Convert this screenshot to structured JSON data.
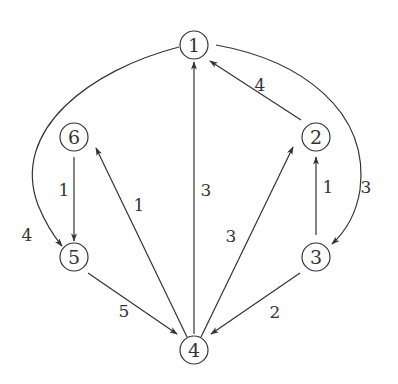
{
  "graph": {
    "type": "directed-weighted",
    "colors": {
      "stroke": "#333333",
      "background": "#ffffff"
    },
    "nodes": [
      {
        "id": "1",
        "label": "1",
        "x": 194,
        "y": 45
      },
      {
        "id": "2",
        "label": "2",
        "x": 316,
        "y": 137
      },
      {
        "id": "3",
        "label": "3",
        "x": 316,
        "y": 257
      },
      {
        "id": "4",
        "label": "4",
        "x": 194,
        "y": 350
      },
      {
        "id": "5",
        "label": "5",
        "x": 74,
        "y": 257
      },
      {
        "id": "6",
        "label": "6",
        "x": 74,
        "y": 137
      }
    ],
    "edges": [
      {
        "from": "1",
        "to": "5",
        "weight": "4",
        "curved": true
      },
      {
        "from": "6",
        "to": "5",
        "weight": "1"
      },
      {
        "from": "4",
        "to": "6",
        "weight": "1"
      },
      {
        "from": "4",
        "to": "1",
        "weight": "3"
      },
      {
        "from": "4",
        "to": "2",
        "weight": "3"
      },
      {
        "from": "2",
        "to": "1",
        "weight": "4"
      },
      {
        "from": "3",
        "to": "2",
        "weight": "1"
      },
      {
        "from": "1",
        "to": "3",
        "weight": "3",
        "curved": true
      },
      {
        "from": "5",
        "to": "4",
        "weight": "5"
      },
      {
        "from": "3",
        "to": "4",
        "weight": "2"
      }
    ]
  }
}
